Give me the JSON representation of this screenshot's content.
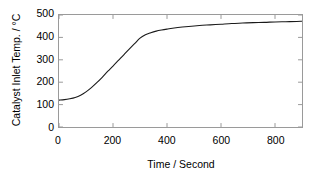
{
  "chart_data": {
    "type": "line",
    "title": "",
    "xlabel": "Time / Second",
    "ylabel": "Catalyst Inlet Temp. / °C",
    "xlim": [
      0,
      900
    ],
    "ylim": [
      0,
      500
    ],
    "xticks": [
      0,
      200,
      400,
      600,
      800
    ],
    "yticks": [
      0,
      100,
      200,
      300,
      400,
      500
    ],
    "xtick_labels": [
      "0",
      "200",
      "400",
      "600",
      "800"
    ],
    "ytick_labels": [
      "0",
      "100",
      "200",
      "300",
      "400",
      "500"
    ],
    "grid": false,
    "legend": null,
    "series": [
      {
        "name": "Catalyst Inlet Temperature",
        "color": "#1a1a1a",
        "x": [
          0,
          20,
          40,
          60,
          80,
          100,
          120,
          140,
          160,
          180,
          200,
          220,
          240,
          260,
          280,
          300,
          320,
          340,
          360,
          380,
          400,
          440,
          480,
          520,
          560,
          600,
          640,
          680,
          720,
          760,
          800,
          840,
          880,
          900
        ],
        "y": [
          120,
          122,
          126,
          132,
          142,
          157,
          176,
          198,
          222,
          248,
          272,
          297,
          322,
          348,
          372,
          397,
          412,
          421,
          428,
          433,
          437,
          444,
          449,
          453,
          456,
          459,
          462,
          464,
          466,
          467,
          469,
          470,
          471,
          472
        ]
      }
    ]
  },
  "axes": {
    "frame_color": "#9a9a9a",
    "tick_color": "#9a9a9a",
    "text_color": "#000000",
    "background": "#ffffff"
  }
}
